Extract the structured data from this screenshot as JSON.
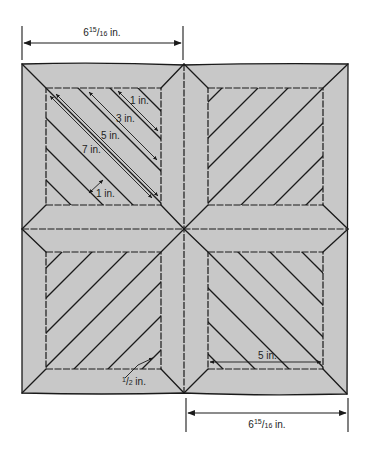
{
  "figure": {
    "type": "quilt-block-diagram",
    "colors": {
      "fabric": "#c8c8c8",
      "line": "#1a1a1a",
      "background": "#ffffff"
    }
  },
  "dimensions": {
    "top": {
      "whole": "6",
      "num": "15",
      "den": "16",
      "unit": " in."
    },
    "bottom": {
      "whole": "6",
      "num": "15",
      "den": "16",
      "unit": " in."
    }
  },
  "top_left_block": {
    "strip_labels": [
      "1 in.",
      "3 in.",
      "5 in.",
      "7 in."
    ],
    "spacing_label": "1 in."
  },
  "bottom_left_block": {
    "corner_label": "½ in.",
    "corner_label_whole": "1",
    "corner_label_den": "2",
    "corner_label_unit": " in."
  },
  "bottom_right_block": {
    "width_label": "5 in."
  }
}
